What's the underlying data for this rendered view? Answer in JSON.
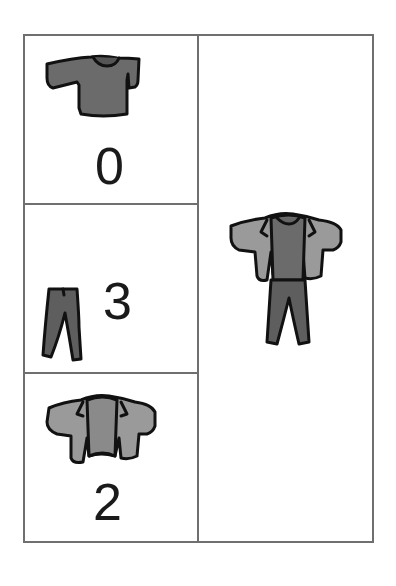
{
  "figure": {
    "left_panels": [
      {
        "item": "t-shirt",
        "count": "0"
      },
      {
        "item": "pants",
        "count": "3"
      },
      {
        "item": "jacket",
        "count": "2"
      }
    ],
    "right_panel": {
      "item": "outfit (jacket over t-shirt with pants)"
    }
  },
  "colors": {
    "border": "#6f6f6f",
    "tshirt_fill": "#6b6b6b",
    "pants_fill": "#5e5e5e",
    "jacket_fill": "#9a9a9a",
    "outline": "#111111"
  }
}
